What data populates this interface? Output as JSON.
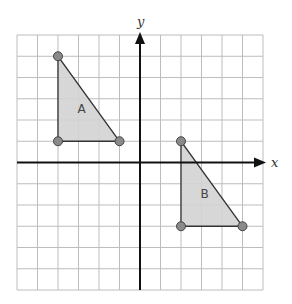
{
  "grid": {
    "x0": 17,
    "y0": 35,
    "x1": 263,
    "y1": 290,
    "cols": 12,
    "rows": 12,
    "origin_col": 6,
    "origin_row": 6,
    "line_color": "#bdbdbd"
  },
  "axes": {
    "x_label": "x",
    "y_label": "y",
    "color": "#111111"
  },
  "shapes": [
    {
      "label": "A",
      "vertices": [
        [
          -4,
          5
        ],
        [
          -4,
          1
        ],
        [
          -1,
          1
        ]
      ],
      "label_pos": [
        -3,
        2.5
      ]
    },
    {
      "label": "B",
      "vertices": [
        [
          2,
          1
        ],
        [
          2,
          -3
        ],
        [
          5,
          -3
        ]
      ],
      "label_pos": [
        3,
        -1.5
      ]
    }
  ],
  "style": {
    "fill": "#d3d3d3",
    "stroke": "#333333",
    "vertex_fill": "#8a8a8a",
    "vertex_stroke": "#444444"
  }
}
